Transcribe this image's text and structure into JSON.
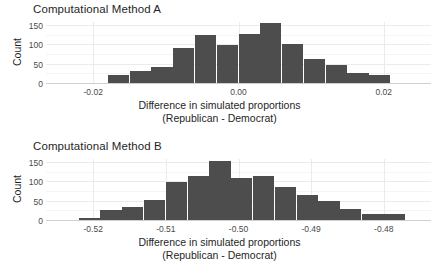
{
  "figure": {
    "background_color": "#ffffff",
    "bar_color": "#4d4d4d",
    "grid_color": "#ebebeb",
    "axis_color": "#cfcfcf",
    "text_color": "#1f1f1f"
  },
  "panels": [
    {
      "id": "method-a",
      "title": "Computational Method A",
      "ylabel": "Count",
      "xlabel_line1": "Difference in simulated proportions",
      "xlabel_line2": "(Republican - Democrat)"
    },
    {
      "id": "method-b",
      "title": "Computational Method B",
      "ylabel": "Count",
      "xlabel_line1": "Difference in simulated proportions",
      "xlabel_line2": "(Republican - Democrat)"
    }
  ],
  "chart_data": [
    {
      "type": "bar",
      "id": "method-a",
      "title": "Computational Method A",
      "xlabel": "Difference in simulated proportions (Republican - Democrat)",
      "ylabel": "Count",
      "grid": true,
      "legend": "none",
      "xlim": [
        -0.0265,
        0.0265
      ],
      "ylim": [
        0,
        160
      ],
      "xticks": [
        -0.02,
        0.0,
        0.02
      ],
      "xtick_labels": [
        "-0.02",
        "0.00",
        "0.02"
      ],
      "yticks": [
        0,
        50,
        100,
        150
      ],
      "ytick_labels": [
        "0",
        "50",
        "100",
        "150"
      ],
      "bin_width": 0.003,
      "bin_centers": [
        -0.0225,
        -0.0195,
        -0.0165,
        -0.0135,
        -0.0105,
        -0.0075,
        -0.0045,
        -0.0015,
        0.0015,
        0.0045,
        0.0075,
        0.0105,
        0.0135,
        0.0165,
        0.0195
      ],
      "bin_edges": [
        -0.024,
        -0.021,
        -0.018,
        -0.015,
        -0.012,
        -0.009,
        -0.006,
        -0.003,
        0.0,
        0.003,
        0.006,
        0.009,
        0.012,
        0.015,
        0.018,
        0.021
      ],
      "categories": [
        "-0.0225",
        "-0.0195",
        "-0.0165",
        "-0.0135",
        "-0.0105",
        "-0.0075",
        "-0.0045",
        "-0.0015",
        "0.0015",
        "0.0045",
        "0.0075",
        "0.0105",
        "0.0135",
        "0.0165",
        "0.0195"
      ],
      "values": [
        1,
        2,
        24,
        34,
        45,
        94,
        127,
        100,
        128,
        157,
        103,
        65,
        49,
        29,
        24
      ]
    },
    {
      "type": "bar",
      "id": "method-b",
      "title": "Computational Method B",
      "xlabel": "Difference in simulated proportions (Republican - Democrat)",
      "ylabel": "Count",
      "grid": true,
      "legend": "none",
      "xlim": [
        -0.5265,
        -0.4735
      ],
      "ylim": [
        0,
        160
      ],
      "xticks": [
        -0.52,
        -0.51,
        -0.5,
        -0.49,
        -0.48
      ],
      "xtick_labels": [
        "-0.52",
        "-0.51",
        "-0.50",
        "-0.49",
        "-0.48"
      ],
      "yticks": [
        0,
        50,
        100,
        150
      ],
      "ytick_labels": [
        "0",
        "50",
        "100",
        "150"
      ],
      "bin_width": 0.003,
      "bin_centers": [
        -0.5235,
        -0.5205,
        -0.5175,
        -0.5145,
        -0.5115,
        -0.5085,
        -0.5055,
        -0.5025,
        -0.4995,
        -0.4965,
        -0.4935,
        -0.4905,
        -0.4875,
        -0.4845,
        -0.4785
      ],
      "bin_edges": [
        -0.525,
        -0.522,
        -0.519,
        -0.516,
        -0.513,
        -0.51,
        -0.507,
        -0.504,
        -0.501,
        -0.498,
        -0.495,
        -0.492,
        -0.489,
        -0.486,
        -0.483,
        -0.477
      ],
      "categories": [
        "-0.5235",
        "-0.5205",
        "-0.5175",
        "-0.5145",
        "-0.5115",
        "-0.5085",
        "-0.5055",
        "-0.5025",
        "-0.4995",
        "-0.4965",
        "-0.4935",
        "-0.4905",
        "-0.4875",
        "-0.4845",
        "-0.4785"
      ],
      "values": [
        2,
        8,
        29,
        36,
        54,
        100,
        115,
        156,
        112,
        117,
        88,
        68,
        51,
        31,
        19,
        3
      ]
    }
  ]
}
